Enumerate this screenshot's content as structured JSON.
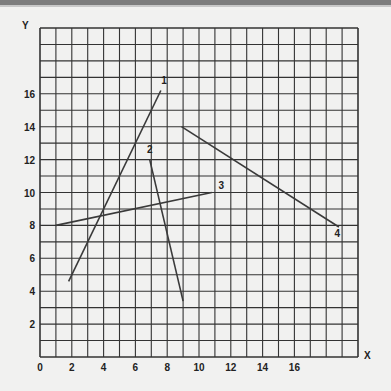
{
  "chart_data": {
    "type": "line",
    "title": "",
    "xlabel": "X",
    "ylabel": "Y",
    "xlim": [
      0,
      20
    ],
    "ylim": [
      0,
      20
    ],
    "grid": true,
    "grid_step": 1,
    "x_ticks": [
      "0",
      "2",
      "4",
      "6",
      "8",
      "10",
      "12",
      "14",
      "16"
    ],
    "y_ticks": [
      "2",
      "4",
      "6",
      "8",
      "10",
      "12",
      "14",
      "16"
    ],
    "series": [
      {
        "name": "1",
        "points": [
          [
            1.8,
            4.6
          ],
          [
            7.6,
            16.2
          ]
        ],
        "label_at": [
          7.8,
          16.6
        ]
      },
      {
        "name": "2",
        "points": [
          [
            6.9,
            12.0
          ],
          [
            9.0,
            3.4
          ]
        ],
        "label_at": [
          6.9,
          12.4
        ]
      },
      {
        "name": "3",
        "points": [
          [
            1.0,
            8.0
          ],
          [
            10.8,
            10.0
          ]
        ],
        "label_at": [
          11.4,
          10.2
        ]
      },
      {
        "name": "4",
        "points": [
          [
            8.9,
            14.0
          ],
          [
            18.8,
            7.9
          ]
        ],
        "label_at": [
          18.7,
          7.3
        ]
      }
    ],
    "legend": "none (lines labeled inline with numbers 1-4)"
  },
  "colors": {
    "background": "#f1f1f0",
    "grid": "#333333",
    "line": "#3a3a3a",
    "topbar": "#7d7d7d"
  }
}
